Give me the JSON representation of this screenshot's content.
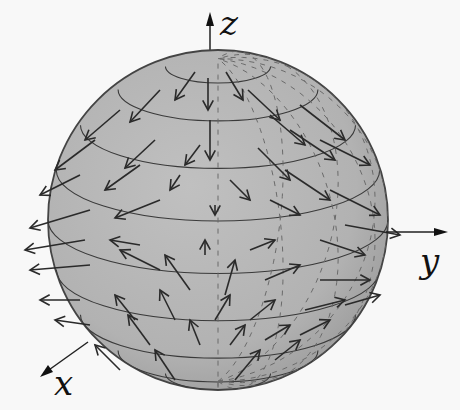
{
  "figure": {
    "colors": {
      "background": "#f8f8f8",
      "sphere_fill": "#b4b4b4",
      "sphere_edge": "#444444",
      "arrows": "#2a2a2a",
      "latitude_lines": "#3a3a3a",
      "meridians_dashed": "#6a6a6a"
    },
    "axes": {
      "x": {
        "label": "x"
      },
      "y": {
        "label": "y"
      },
      "z": {
        "label": "z"
      }
    }
  }
}
